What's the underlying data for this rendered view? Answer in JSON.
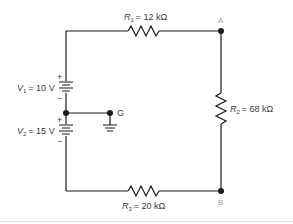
{
  "diagram": {
    "type": "circuit-schematic",
    "resistors": [
      {
        "id": "R1",
        "symbol": "R",
        "subscript": "1",
        "value": "= 12 kΩ",
        "position": "top"
      },
      {
        "id": "R2",
        "symbol": "R",
        "subscript": "2",
        "value": "= 68 kΩ",
        "position": "right"
      },
      {
        "id": "R3",
        "symbol": "R",
        "subscript": "3",
        "value": "= 20 kΩ",
        "position": "bottom"
      }
    ],
    "sources": [
      {
        "id": "V1",
        "symbol": "V",
        "subscript": "1",
        "value": "= 10 V",
        "plus": "+",
        "minus": "−"
      },
      {
        "id": "V2",
        "symbol": "V",
        "subscript": "2",
        "value": "= 15 V",
        "plus": "+",
        "minus": "−"
      }
    ],
    "nodes": [
      {
        "id": "A",
        "label": "A"
      },
      {
        "id": "B",
        "label": "B"
      },
      {
        "id": "G",
        "label": "G"
      }
    ],
    "colors": {
      "wire": "#1a1a1a",
      "label": "#3a3a3a",
      "node_label": "#a0a0a0"
    }
  }
}
